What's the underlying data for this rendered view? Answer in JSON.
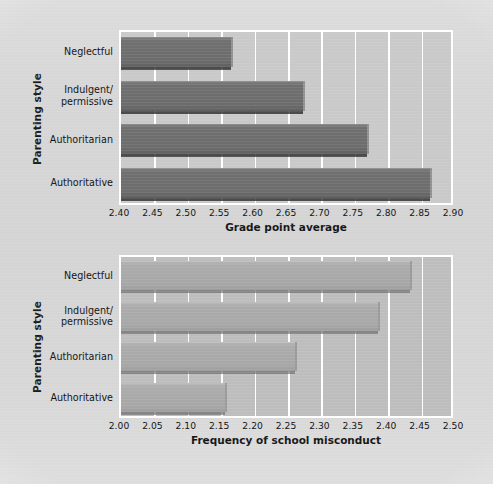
{
  "figure": {
    "background_color": "#d6d6d6",
    "shared_y_axis_title": "Parenting style"
  },
  "chart_data": [
    {
      "type": "bar",
      "orientation": "horizontal",
      "title": "",
      "xlabel": "Grade point average",
      "ylabel": "Parenting style",
      "xlim": [
        2.4,
        2.9
      ],
      "xticks": [
        "2.40",
        "2.45",
        "2.50",
        "2.55",
        "2.60",
        "2.65",
        "2.70",
        "2.75",
        "2.80",
        "2.85",
        "2.90"
      ],
      "grid": true,
      "legend": "none",
      "bar_color": "#6f6f6f",
      "categories": [
        "Neglectful",
        "Indulgent/permissive",
        "Authoritarian",
        "Authoritative"
      ],
      "category_lines": [
        [
          "Neglectful"
        ],
        [
          "Indulgent/",
          "permissive"
        ],
        [
          "Authoritarian"
        ],
        [
          "Authoritative"
        ]
      ],
      "values": [
        2.565,
        2.672,
        2.768,
        2.862
      ]
    },
    {
      "type": "bar",
      "orientation": "horizontal",
      "title": "",
      "xlabel": "Frequency of school misconduct",
      "ylabel": "Parenting style",
      "xlim": [
        2.0,
        2.5
      ],
      "xticks": [
        "2.00",
        "2.05",
        "2.10",
        "2.15",
        "2.20",
        "2.25",
        "2.30",
        "2.35",
        "2.40",
        "2.45",
        "2.50"
      ],
      "grid": true,
      "legend": "none",
      "bar_color": "#a7a7a7",
      "categories": [
        "Neglectful",
        "Indulgent/permissive",
        "Authoritarian",
        "Authoritative"
      ],
      "category_lines": [
        [
          "Neglectful"
        ],
        [
          "Indulgent/",
          "permissive"
        ],
        [
          "Authoritarian"
        ],
        [
          "Authoritative"
        ]
      ],
      "values": [
        2.432,
        2.385,
        2.26,
        2.155
      ]
    }
  ]
}
